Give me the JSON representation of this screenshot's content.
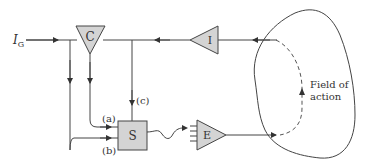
{
  "diagram": {
    "input_label": "I",
    "input_subscript": "G",
    "blocks": {
      "comparator": "C",
      "sensor": "I",
      "selector": "S",
      "effector": "E"
    },
    "signal_labels": {
      "a": "(a)",
      "b": "(b)",
      "c": "(c)"
    },
    "field_label_line1": "Field of",
    "field_label_line2": "action"
  },
  "colors": {
    "block_fill": "#d4d4d4",
    "line": "#444444",
    "background": "#ffffff"
  }
}
